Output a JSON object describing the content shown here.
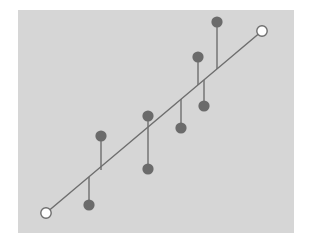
{
  "figure": {
    "background_color": "#ffffff",
    "panel_color": "#d6d6d6",
    "panel": {
      "x": 18,
      "y": 10,
      "width": 276,
      "height": 223
    }
  },
  "style": {
    "line_color": "#6e6e6e",
    "line_width": 1.4,
    "stem_color": "#6e6e6e",
    "stem_width": 1.4,
    "point_fill": "#6b6b6b",
    "point_radius": 5.6,
    "endpoint_fill": "#ffffff",
    "endpoint_stroke": "#6e6e6e",
    "endpoint_radius": 5.2
  },
  "chart_data": {
    "type": "scatter",
    "title": "",
    "subtitle": "",
    "xlabel": "",
    "ylabel": "",
    "grid": false,
    "legend": false,
    "axes_visible": false,
    "tick_labels": [],
    "annotations": [],
    "xlim": [
      18,
      294
    ],
    "ylim": [
      233,
      10
    ],
    "reference_line": {
      "name": "identity-line",
      "x1": 46,
      "y1": 213,
      "x2": 262,
      "y2": 31,
      "endpoint_marker": "open-circle"
    },
    "endpoints": [
      {
        "label": "start",
        "x": 46,
        "y": 213
      },
      {
        "label": "end",
        "x": 262,
        "y": 31
      }
    ],
    "series": [
      {
        "name": "observations",
        "marker": "filled-circle",
        "points": [
          {
            "x": 101,
            "y": 136,
            "line_y": 170,
            "side": "above"
          },
          {
            "x": 89,
            "y": 205,
            "line_y": 177,
            "side": "below"
          },
          {
            "x": 148,
            "y": 116,
            "line_y": 127,
            "side": "above"
          },
          {
            "x": 148,
            "y": 169,
            "line_y": 127,
            "side": "below"
          },
          {
            "x": 181,
            "y": 128,
            "line_y": 99,
            "side": "below"
          },
          {
            "x": 198,
            "y": 57,
            "line_y": 85,
            "side": "above"
          },
          {
            "x": 204,
            "y": 106,
            "line_y": 80,
            "side": "below"
          },
          {
            "x": 217,
            "y": 22,
            "line_y": 69,
            "side": "above"
          }
        ]
      }
    ]
  }
}
